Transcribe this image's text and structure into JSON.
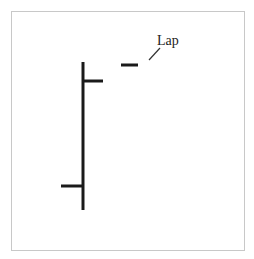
{
  "figure": {
    "label": "Lap",
    "colors": {
      "stroke": "#1a1a1a",
      "frame": "#c8c8c8",
      "leader": "#333333",
      "background": "#ffffff"
    }
  }
}
